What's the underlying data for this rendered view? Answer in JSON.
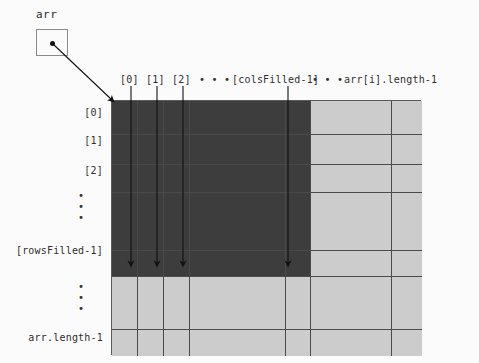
{
  "diagram": {
    "title_label": "arr",
    "pointer": {
      "name": "arr",
      "box_label": "arr"
    },
    "column_headers": [
      {
        "id": "c0",
        "label": "[0]",
        "x": 120
      },
      {
        "id": "c1",
        "label": "[1]",
        "x": 146
      },
      {
        "id": "c2",
        "label": "[2]",
        "x": 172
      },
      {
        "id": "dots1",
        "label": "• • •",
        "x": 199
      },
      {
        "id": "colsfilled",
        "label": "[colsFilled-1]",
        "x": 232
      },
      {
        "id": "dots2",
        "label": "• • •",
        "x": 312
      },
      {
        "id": "arrlen",
        "label": "arr[i].length-1",
        "x": 344
      }
    ],
    "row_headers": [
      {
        "id": "r0",
        "label": "[0]",
        "y": 107
      },
      {
        "id": "r1",
        "label": "[1]",
        "y": 135
      },
      {
        "id": "r2",
        "label": "[2]",
        "y": 165
      },
      {
        "id": "rrowsfilled",
        "label": "[rowsFilled-1]",
        "y": 245
      },
      {
        "id": "rarrlen",
        "label": "arr.length-1",
        "y": 332
      }
    ],
    "row_ellipsis": [
      {
        "id": "dots-upper",
        "dots": [
          "•",
          "•",
          "•"
        ],
        "x": 75,
        "y": 190
      },
      {
        "id": "dots-lower",
        "dots": [
          "•",
          "•",
          "•"
        ],
        "x": 75,
        "y": 281
      }
    ],
    "grid": {
      "cols": [
        {
          "id": "col0",
          "x": 0,
          "w": 26
        },
        {
          "id": "col1",
          "x": 26,
          "w": 26
        },
        {
          "id": "col2",
          "x": 52,
          "w": 26
        },
        {
          "id": "col3",
          "x": 78,
          "w": 96
        },
        {
          "id": "col4",
          "x": 174,
          "w": 25
        },
        {
          "id": "col5",
          "x": 199,
          "w": 81
        },
        {
          "id": "col6",
          "x": 280,
          "w": 30
        }
      ],
      "rows": [
        {
          "id": "row0",
          "y": 0,
          "h": 34
        },
        {
          "id": "row1",
          "y": 34,
          "h": 30
        },
        {
          "id": "row2",
          "y": 64,
          "h": 28
        },
        {
          "id": "row3",
          "y": 92,
          "h": 58
        },
        {
          "id": "row4",
          "y": 150,
          "h": 26
        },
        {
          "id": "row5",
          "y": 176,
          "h": 53
        },
        {
          "id": "row6",
          "y": 229,
          "h": 26
        }
      ],
      "filled_cols": 5,
      "filled_rows": 5,
      "fill_color": "#3d3d3d",
      "empty_color": "#cccccc",
      "line_color": "#4a4a4a"
    },
    "arrows": [
      {
        "id": "arrow-col0",
        "x": 131,
        "y1": 86,
        "y2": 264
      },
      {
        "id": "arrow-col1",
        "x": 157,
        "y1": 86,
        "y2": 264
      },
      {
        "id": "arrow-col2",
        "x": 183,
        "y1": 86,
        "y2": 264
      },
      {
        "id": "arrow-colsfilled",
        "x": 288,
        "y1": 86,
        "y2": 264
      }
    ],
    "pointer_arrow": {
      "x1": 53,
      "y1": 44,
      "x2": 112,
      "y2": 100
    }
  }
}
